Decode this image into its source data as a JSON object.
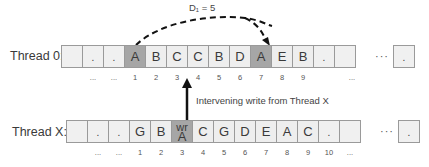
{
  "colors": {
    "cell_fill": "#eeeeee",
    "highlight_fill": "#a6a6a6",
    "border": "#9a9a9a",
    "arrow": "#111111"
  },
  "distance_label": "D₁ = 5",
  "intervening_label": "Intervening write from Thread X",
  "thread0": {
    "label": "Thread 0:",
    "cells": [
      "",
      ".",
      ".",
      "A",
      "B",
      "C",
      "C",
      "B",
      "D",
      "A",
      "E",
      "B",
      ".",
      ""
    ],
    "highlighted": [
      3,
      9
    ],
    "ellipsis": "···",
    "last_cell": ".",
    "indices": [
      "...",
      "...",
      "1",
      "2",
      "3",
      "4",
      "5",
      "6",
      "7",
      "8",
      "9",
      "..."
    ]
  },
  "threadX": {
    "label": "Thread X:",
    "cells": [
      "",
      ".",
      ".",
      "G",
      "B",
      "wr A",
      "C",
      "G",
      "D",
      "E",
      "A",
      "C",
      ".",
      ""
    ],
    "highlighted": [
      5
    ],
    "write_cell": {
      "top": "wr",
      "bottom": "A"
    },
    "ellipsis": "···",
    "last_cell": ".",
    "indices": [
      "...",
      "...",
      "1",
      "2",
      "3",
      "4",
      "5",
      "6",
      "7",
      "8",
      "9",
      "10",
      "..."
    ]
  }
}
